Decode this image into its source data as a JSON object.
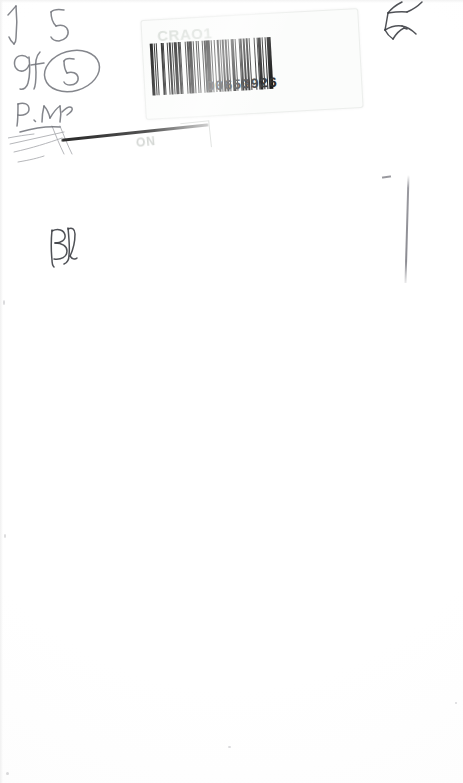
{
  "document": {
    "type": "scanned-page",
    "page_width": 463,
    "page_height": 783,
    "background_color": "#fefefe",
    "description": "Blank scanned sheet with an adhesive barcode label and handwritten pencil annotations"
  },
  "barcode_label": {
    "header_text": "CRAO1",
    "number": "D0653926",
    "ink_color": "#141414",
    "label_color": "#fbfcfb",
    "rotation_degrees": -3.2,
    "bar_pattern": [
      3,
      1,
      1,
      2,
      1,
      4,
      2,
      1,
      1,
      3,
      1,
      1,
      2,
      2,
      1,
      1,
      3,
      1,
      2,
      1,
      1,
      4,
      1,
      1,
      2,
      1,
      3,
      1,
      1,
      2,
      2,
      1,
      1,
      3,
      1,
      1,
      2,
      1,
      4,
      1,
      1,
      2,
      1,
      3,
      2,
      1,
      1,
      1,
      3,
      1,
      2,
      1,
      1,
      2,
      4,
      1,
      1,
      3,
      1,
      1,
      2,
      1,
      2,
      1,
      3,
      1,
      1,
      4,
      1,
      2,
      1,
      1,
      3,
      1,
      1,
      2,
      2,
      1,
      4,
      1
    ]
  },
  "secondary_label": {
    "ghost_text": "ON",
    "note": "partially obscured second label beneath, smudged"
  },
  "annotations": {
    "arrow_mark": "arrow",
    "digit_top": "5",
    "initials_left": "Gf",
    "circled_digit": "5",
    "time_mark": "P. M.",
    "signature_initials": "BJ",
    "corner_scribble": "scribble",
    "ink_color": "#6f7178"
  },
  "artifacts": {
    "vertical_line": "scan edge line",
    "tick_mark": "tick"
  }
}
